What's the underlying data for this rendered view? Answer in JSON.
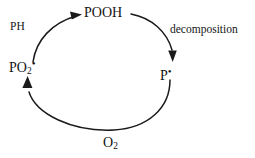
{
  "diagram": {
    "title_visible": false,
    "background_color": "#ffffff",
    "stroke_color": "#1a1a1a",
    "type": "cyclic-reaction-scheme",
    "species": {
      "top": {
        "name": "pooh",
        "text": "POOH"
      },
      "right": {
        "name": "p-radical",
        "base": "P",
        "radical": "•"
      },
      "left": {
        "name": "po2-radical",
        "base": "PO",
        "subscript": "2",
        "radical": "•"
      },
      "bottom_reactant": {
        "name": "oxygen",
        "base": "O",
        "subscript": "2"
      }
    },
    "annotations": {
      "upper_left": {
        "name": "ph-reactant",
        "text": "PH"
      },
      "upper_right": {
        "name": "decomposition-step",
        "text": "decomposition"
      }
    },
    "arrows": [
      {
        "name": "arrow-po2-to-pooh",
        "from": "PO2•",
        "to": "POOH",
        "label": "PH",
        "head": "right"
      },
      {
        "name": "arrow-pooh-to-p",
        "from": "POOH",
        "to": "P•",
        "label": "decomposition",
        "head": "down"
      },
      {
        "name": "arrow-p-to-po2",
        "from": "P•",
        "to": "PO2•",
        "label": "O2",
        "head": "up"
      }
    ]
  }
}
